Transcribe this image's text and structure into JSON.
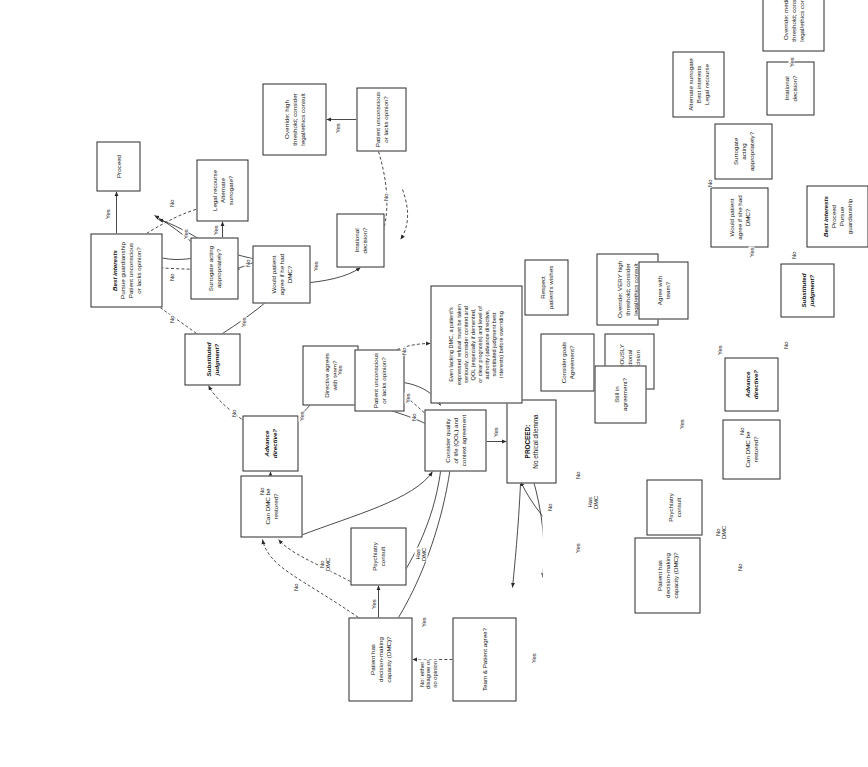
{
  "diagram": {
    "orientation": "landscape artwork rotated 90 degrees counter-clockwise on a portrait page",
    "colors": {
      "stroke": "#2a2a2a",
      "text": "#111111",
      "background": "#ffffff"
    }
  },
  "nodes": {
    "team_patient_agree": "Team & Patient agree?",
    "patient_has_dmc_upper": "Patient has\ndecision-making\ncapacity (DMC)?",
    "psychiatry_consult_upper": "Psychiatry\nconsult",
    "can_dmc_be_restored_upper": "Can DMC be\nrestored?",
    "consider_qol": "Consider quality\nof life (QOL) and\ncontext agreement",
    "proceed_no_ethical_dilemma_head": "PROCEED:",
    "proceed_no_ethical_dilemma_body": "No ethical dilemma",
    "advance_directive_upper": "Advance\ndirective?",
    "directive_agrees_with_team": "Directive agrees\nwith team?",
    "substituted_judgment_upper": "Substituted\njudgment?",
    "best_interests_upper_head": "Best interests",
    "best_interests_upper_body": "Pursue guardianship\nPatient unconscious\nor lacks opinion?",
    "proceed": "Proceed",
    "would_patient_agree_he": "Would patient\nagree if he had\nDMC?",
    "surrogate_acting_appropriately_upper": "Surrogate acting\nappropriately?",
    "legal_recourse_alternate_surrogate": "Legal recourse\nAlternate surrogate?",
    "irrational_decision_upper": "Irrational\ndecision?",
    "patient_unconscious_upper": "Patient unconscious\nor lacks opinion?",
    "override_high_threshold": "Override: high\nthreshold; consider\nlegal/ethics consult",
    "even_lacking_dmc": "Even lacking DMC, a patient's\nexpressed refusal must be taken\nseriously; consider context and\nQOL (especially if demented,\nor clear prognosis) and level of\nauthority (advance directive,\nsubstituted judgment best\ninterests) before overriding",
    "patient_unconscious_mid": "Patient unconscious\nor lacks opinion?",
    "consider_goals_agreement": "Consider goals\nAgreement?",
    "seriously_irrational_decision": "SERIOUSLY\nirrational\ndecision",
    "respect_patients_wishes": "Respect\npatient's wishes",
    "override_very_high_threshold": "Override: VERY high\nthreshold; consider\nlegal/ethics consult",
    "patient_has_dmc_lower": "Patient has\ndecision-making\ncapacity (DMC)?",
    "psychiatry_consult_lower": "Psychiatry\nconsult",
    "can_dmc_be_restored_lower": "Can DMC be\nrestored?",
    "still_in_agreement": "Still in\nagreement?",
    "agree_with_team": "Agree with\nteam?",
    "advance_directive_lower": "Advance\ndirective?",
    "substituted_judgment_lower": "Substituted\njudgment?",
    "best_interests_lower_head": "Best interests",
    "best_interests_lower_body": "Proceed\nPursue\nguardianship",
    "would_patient_agree_she": "Would patient\nagree if she had\nDMC?",
    "surrogate_acting_appropriately_lower": "Surrogate\nacting\nappropriately?",
    "alternate_surrogate_best_interests": "Alternate surrogate\nBest interests\nLegal recourse",
    "irrational_decision_lower": "Irrational\ndecision?",
    "override_medium_threshold": "Override: medium\nthreshold; consider\nlegal/ethics consult"
  },
  "edge_labels": {
    "no_either_disagree": "No: either\ndisagree or\nno opinion",
    "yes_a": "Yes",
    "yes_b": "Yes",
    "yes_c": "Yes",
    "yes_d": "Yes",
    "yes_e": "Yes",
    "yes_f": "Yes",
    "yes_g": "Yes",
    "yes_h": "Yes",
    "yes_i": "Yes",
    "yes_j": "Yes",
    "yes_k": "Yes",
    "yes_l": "Yes",
    "yes_m": "Yes",
    "yes_n": "Yes",
    "yes_o": "Yes",
    "yes_p": "Yes",
    "yes_q": "Yes",
    "yes_r": "Yes",
    "no_a": "No",
    "no_b": "No",
    "no_c": "No",
    "no_d": "No",
    "no_e": "No",
    "no_f": "No",
    "no_g": "No",
    "no_h": "No",
    "no_i": "No",
    "no_j": "No",
    "no_k": "No",
    "no_l": "No",
    "no_m": "No",
    "no_n": "No",
    "no_o": "No",
    "no_p": "No",
    "no_q": "No",
    "no_dmc_a": "No\nDMC",
    "no_dmc_b": "No\nDMC",
    "has_dmc_a": "Has\nDMC",
    "has_dmc_b": "Has\nDMC"
  }
}
